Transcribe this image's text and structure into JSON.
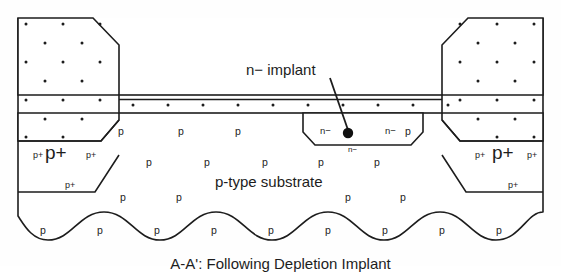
{
  "figure": {
    "domain": "semiconductor-cross-section",
    "caption": "A-A': Following Depletion Implant",
    "colors": {
      "line": "#1d1d1d",
      "fill": "#ffffff",
      "background": "#fefefe",
      "text": "#1d1d1d",
      "leader_dot": "#101010"
    }
  },
  "callout": {
    "implant_label": "n− implant",
    "leader_dot_label": "leader-dot"
  },
  "regions": {
    "substrate_label": "p-type substrate",
    "p_label": "p",
    "pplus_label": "p+",
    "pplus_sup_label": "p+",
    "nminus_label": "n−"
  },
  "substrate_p_marks": [
    {
      "x": 118,
      "y": 126
    },
    {
      "x": 178,
      "y": 126
    },
    {
      "x": 235,
      "y": 126
    },
    {
      "x": 405,
      "y": 126
    },
    {
      "x": 146,
      "y": 157
    },
    {
      "x": 204,
      "y": 157
    },
    {
      "x": 262,
      "y": 157
    },
    {
      "x": 318,
      "y": 157
    },
    {
      "x": 374,
      "y": 157
    },
    {
      "x": 120,
      "y": 192
    },
    {
      "x": 176,
      "y": 192
    },
    {
      "x": 345,
      "y": 192
    },
    {
      "x": 400,
      "y": 192
    },
    {
      "x": 40,
      "y": 225
    },
    {
      "x": 97,
      "y": 225
    },
    {
      "x": 154,
      "y": 225
    },
    {
      "x": 211,
      "y": 225
    },
    {
      "x": 268,
      "y": 225
    },
    {
      "x": 325,
      "y": 225
    },
    {
      "x": 382,
      "y": 225
    },
    {
      "x": 439,
      "y": 225
    },
    {
      "x": 496,
      "y": 225
    }
  ],
  "nminus_marks": [
    {
      "x": 320,
      "y": 126,
      "size": "small"
    },
    {
      "x": 385,
      "y": 126,
      "size": "small"
    },
    {
      "x": 348,
      "y": 146,
      "size": "tiny"
    }
  ],
  "pplus_left": {
    "main": {
      "x": 53,
      "y": 153
    },
    "sups": [
      {
        "x": 33,
        "y": 151
      },
      {
        "x": 86,
        "y": 151
      },
      {
        "x": 65,
        "y": 181
      }
    ]
  },
  "pplus_right": {
    "main": {
      "x": 500,
      "y": 153
    },
    "sups": [
      {
        "x": 475,
        "y": 151
      },
      {
        "x": 527,
        "y": 151
      },
      {
        "x": 508,
        "y": 181
      }
    ]
  },
  "oxide_dots": [
    {
      "x": 133,
      "y": 105
    },
    {
      "x": 168,
      "y": 105
    },
    {
      "x": 203,
      "y": 105
    },
    {
      "x": 238,
      "y": 105
    },
    {
      "x": 273,
      "y": 105
    },
    {
      "x": 308,
      "y": 105
    },
    {
      "x": 343,
      "y": 105
    },
    {
      "x": 378,
      "y": 105
    },
    {
      "x": 413,
      "y": 105
    },
    {
      "x": 448,
      "y": 105
    }
  ],
  "left_block_dots": [
    {
      "x": 26,
      "y": 24
    },
    {
      "x": 63,
      "y": 24
    },
    {
      "x": 100,
      "y": 24
    },
    {
      "x": 45,
      "y": 43
    },
    {
      "x": 82,
      "y": 43
    },
    {
      "x": 26,
      "y": 62
    },
    {
      "x": 63,
      "y": 62
    },
    {
      "x": 100,
      "y": 62
    },
    {
      "x": 45,
      "y": 81
    },
    {
      "x": 82,
      "y": 81
    },
    {
      "x": 26,
      "y": 100
    },
    {
      "x": 63,
      "y": 100
    },
    {
      "x": 100,
      "y": 100
    },
    {
      "x": 45,
      "y": 119
    },
    {
      "x": 82,
      "y": 119
    },
    {
      "x": 26,
      "y": 137
    },
    {
      "x": 63,
      "y": 137
    }
  ],
  "right_block_dots": [
    {
      "x": 460,
      "y": 24
    },
    {
      "x": 497,
      "y": 24
    },
    {
      "x": 534,
      "y": 24
    },
    {
      "x": 478,
      "y": 43
    },
    {
      "x": 515,
      "y": 43
    },
    {
      "x": 460,
      "y": 62
    },
    {
      "x": 497,
      "y": 62
    },
    {
      "x": 534,
      "y": 62
    },
    {
      "x": 478,
      "y": 81
    },
    {
      "x": 515,
      "y": 81
    },
    {
      "x": 460,
      "y": 100
    },
    {
      "x": 497,
      "y": 100
    },
    {
      "x": 534,
      "y": 100
    },
    {
      "x": 478,
      "y": 119
    },
    {
      "x": 515,
      "y": 119
    },
    {
      "x": 497,
      "y": 137
    },
    {
      "x": 534,
      "y": 137
    }
  ],
  "geometry": {
    "left_block_path": "M 18,18 L 93,18 L 119,45 L 119,92 L 18,92 Z",
    "left_block_lower_path": "M 18,92 L 119,92 L 119,120 L 101,141 L 18,141 Z",
    "left_pplus_path": "M 18,141 L 101,141 L 119,141 L 119,155 L 95,192 L 18,192 Z",
    "right_block_path": "M 543,18 L 468,18 L 442,45 L 442,92 L 543,92 Z",
    "right_pplus_path": "M 543,141 L 460,141 L 442,141 L 442,155 L 466,192 L 543,192 Z",
    "oxide_top_y": 95,
    "oxide_bot_y": 113,
    "nminus_trapezoid": "M 303,113 L 423,113 L 423,133 L 410,145 L 316,145 L 303,133 Z",
    "leader_from": {
      "x": 330,
      "y": 80
    },
    "leader_to": {
      "x": 348,
      "y": 133
    },
    "wave_y": 212,
    "wave_amplitude": 14,
    "wave_periods": 4
  }
}
